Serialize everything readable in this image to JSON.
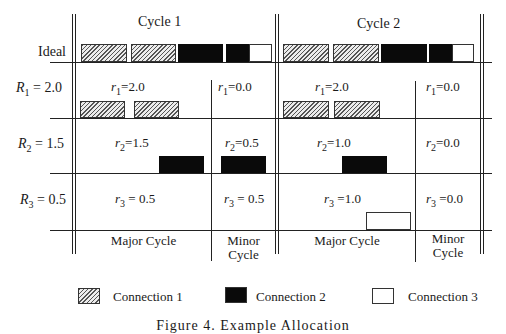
{
  "header": {
    "cycle1": "Cycle 1",
    "cycle2": "Cycle 2"
  },
  "rows": {
    "ideal": "Ideal",
    "r1": {
      "sym": "R",
      "sub": "1",
      "val": " = 2.0"
    },
    "r2": {
      "sym": "R",
      "sub": "2",
      "val": " = 1.5"
    },
    "r3": {
      "sym": "R",
      "sub": "3",
      "val": " = 0.5"
    }
  },
  "cells": {
    "c1_major_r1": {
      "sym": "r",
      "sub": "1",
      "val": "=2.0"
    },
    "c1_minor_r1": {
      "sym": "r",
      "sub": "1",
      "val": "=0.0"
    },
    "c2_major_r1": {
      "sym": "r",
      "sub": "1",
      "val": "=2.0"
    },
    "c2_minor_r1": {
      "sym": "r",
      "sub": "1",
      "val": "=0.0"
    },
    "c1_major_r2": {
      "sym": "r",
      "sub": "2",
      "val": "=1.5"
    },
    "c1_minor_r2": {
      "sym": "r",
      "sub": "2",
      "val": "=0.5"
    },
    "c2_major_r2": {
      "sym": "r",
      "sub": "2",
      "val": "=1.0"
    },
    "c2_minor_r2": {
      "sym": "r",
      "sub": "2",
      "val": "=0.0"
    },
    "c1_major_r3": {
      "sym": "r",
      "sub": "3",
      "val": " = 0.5"
    },
    "c1_minor_r3": {
      "sym": "r",
      "sub": "3",
      "val": " = 0.5"
    },
    "c2_major_r3": {
      "sym": "r",
      "sub": "3",
      "val": " =1.0"
    },
    "c2_minor_r3": {
      "sym": "r",
      "sub": "3",
      "val": " =0.0"
    }
  },
  "footer": {
    "c1_major": "Major Cycle",
    "c1_minor_l1": "Minor",
    "c1_minor_l2": "Cycle",
    "c2_major": "Major Cycle",
    "c2_minor_l1": "Minor",
    "c2_minor_l2": "Cycle"
  },
  "legend": [
    {
      "label": "Connection 1",
      "pattern": "hatched"
    },
    {
      "label": "Connection 2",
      "pattern": "solid-black"
    },
    {
      "label": "Connection 3",
      "pattern": "empty-white"
    }
  ],
  "caption": "Figure 4. Example Allocation",
  "colors": {
    "connection1": "#999999",
    "connection2": "#0a0a0a",
    "connection3": "#ffffff",
    "lines": "#222222"
  }
}
